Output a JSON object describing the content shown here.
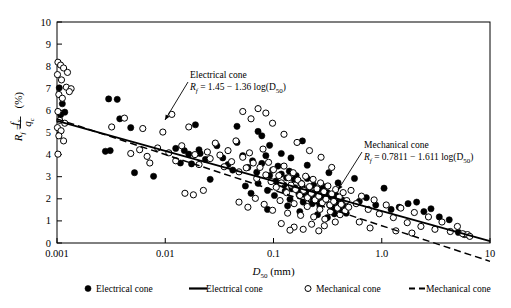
{
  "chart_data": {
    "type": "scatter",
    "title": "",
    "xlabel": "D50 (mm)",
    "xlabel_parts": {
      "main": "D",
      "sub": "50",
      "unit": "(mm)"
    },
    "ylabel": "Rf = fs/qc (%)",
    "ylabel_parts": {
      "r": "R",
      "rsub": "f",
      "eq": "=",
      "num": "f",
      "numsub": "s",
      "den": "q",
      "densub": "c",
      "unit": "(%)"
    },
    "xscale": "log",
    "xlim": [
      0.001,
      10
    ],
    "ylim": [
      0,
      10
    ],
    "xticks": [
      0.001,
      0.01,
      0.1,
      1.0,
      10
    ],
    "xtick_labels": [
      "0.001",
      "0.01",
      "0.1",
      "1.0",
      "10"
    ],
    "yticks": [
      0,
      1,
      2,
      3,
      4,
      5,
      6,
      7,
      8,
      9,
      10
    ],
    "ytick_labels": [
      "0",
      "1",
      "2",
      "3",
      "4",
      "5",
      "6",
      "7",
      "8",
      "9",
      "10"
    ],
    "grid": false,
    "legend_position": "bottom",
    "series": [
      {
        "name": "Electrical cone",
        "marker": "filled-circle",
        "color": "#000000",
        "points": [
          [
            0.00105,
            7.02
          ],
          [
            0.00112,
            6.3
          ],
          [
            0.00118,
            5.92
          ],
          [
            0.00108,
            5.8
          ],
          [
            0.003,
            6.52
          ],
          [
            0.0036,
            6.5
          ],
          [
            0.0038,
            5.62
          ],
          [
            0.0048,
            5.22
          ],
          [
            0.0028,
            4.15
          ],
          [
            0.0031,
            4.18
          ],
          [
            0.0052,
            3.18
          ],
          [
            0.0078,
            3.02
          ],
          [
            0.0125,
            4.28
          ],
          [
            0.015,
            4.18
          ],
          [
            0.0138,
            3.62
          ],
          [
            0.0175,
            3.58
          ],
          [
            0.019,
            5.35
          ],
          [
            0.0205,
            4.22
          ],
          [
            0.0235,
            3.78
          ],
          [
            0.026,
            2.88
          ],
          [
            0.021,
            4.05
          ],
          [
            0.0165,
            4.02
          ],
          [
            0.03,
            4.4
          ],
          [
            0.034,
            3.85
          ],
          [
            0.038,
            3.55
          ],
          [
            0.042,
            3.3
          ],
          [
            0.046,
            4.55
          ],
          [
            0.052,
            3.95
          ],
          [
            0.058,
            3.42
          ],
          [
            0.064,
            3.72
          ],
          [
            0.07,
            3.2
          ],
          [
            0.078,
            3.6
          ],
          [
            0.085,
            3.95
          ],
          [
            0.092,
            3.05
          ],
          [
            0.098,
            3.3
          ],
          [
            0.105,
            2.8
          ],
          [
            0.11,
            3.48
          ],
          [
            0.118,
            3.12
          ],
          [
            0.125,
            2.62
          ],
          [
            0.132,
            2.95
          ],
          [
            0.14,
            3.25
          ],
          [
            0.148,
            2.45
          ],
          [
            0.155,
            2.88
          ],
          [
            0.162,
            3.05
          ],
          [
            0.17,
            2.32
          ],
          [
            0.178,
            2.72
          ],
          [
            0.185,
            2.55
          ],
          [
            0.195,
            2.2
          ],
          [
            0.205,
            2.92
          ],
          [
            0.215,
            2.48
          ],
          [
            0.225,
            2.05
          ],
          [
            0.235,
            2.62
          ],
          [
            0.245,
            2.3
          ],
          [
            0.255,
            1.88
          ],
          [
            0.265,
            2.42
          ],
          [
            0.278,
            2.12
          ],
          [
            0.29,
            2.55
          ],
          [
            0.302,
            1.95
          ],
          [
            0.315,
            2.28
          ],
          [
            0.33,
            1.72
          ],
          [
            0.345,
            2.08
          ],
          [
            0.36,
            1.6
          ],
          [
            0.375,
            2.18
          ],
          [
            0.392,
            1.82
          ],
          [
            0.41,
            1.48
          ],
          [
            0.43,
            1.95
          ],
          [
            0.45,
            1.65
          ],
          [
            0.47,
            1.35
          ],
          [
            0.055,
            2.58
          ],
          [
            0.062,
            2.25
          ],
          [
            0.072,
            2.7
          ],
          [
            0.088,
            2.38
          ],
          [
            0.102,
            2.15
          ],
          [
            0.115,
            2.68
          ],
          [
            0.128,
            2.35
          ],
          [
            0.142,
            1.98
          ],
          [
            0.158,
            2.5
          ],
          [
            0.172,
            2.18
          ],
          [
            0.188,
            1.85
          ],
          [
            0.208,
            2.35
          ],
          [
            0.228,
            1.78
          ],
          [
            0.248,
            2.12
          ],
          [
            0.268,
            1.68
          ],
          [
            0.288,
            2.02
          ],
          [
            0.56,
            2.92
          ],
          [
            0.62,
            1.88
          ],
          [
            0.72,
            2.05
          ],
          [
            0.88,
            1.72
          ],
          [
            1.05,
            2.48
          ],
          [
            1.22,
            1.52
          ],
          [
            1.45,
            1.62
          ],
          [
            1.75,
            1.78
          ],
          [
            2.1,
            1.85
          ],
          [
            2.45,
            1.42
          ],
          [
            2.85,
            1.55
          ],
          [
            3.4,
            1.18
          ],
          [
            4.2,
            1.05
          ],
          [
            5.1,
            0.48
          ],
          [
            5.8,
            0.38
          ],
          [
            0.185,
            4.62
          ],
          [
            0.078,
            4.85
          ],
          [
            0.092,
            4.42
          ],
          [
            0.118,
            4.05
          ],
          [
            0.145,
            3.85
          ],
          [
            0.205,
            3.52
          ],
          [
            0.072,
            5.05
          ],
          [
            0.046,
            5.28
          ],
          [
            0.325,
            3.18
          ],
          [
            0.395,
            2.72
          ],
          [
            0.088,
            1.52
          ],
          [
            0.135,
            1.68
          ],
          [
            0.175,
            1.42
          ],
          [
            0.255,
            1.28
          ],
          [
            0.315,
            1.15
          ],
          [
            0.365,
            1.32
          ]
        ]
      },
      {
        "name": "Mechanical cone",
        "marker": "open-circle",
        "color": "#000000",
        "points": [
          [
            0.00102,
            8.18
          ],
          [
            0.00108,
            8.05
          ],
          [
            0.00115,
            7.92
          ],
          [
            0.00101,
            7.62
          ],
          [
            0.0011,
            7.38
          ],
          [
            0.00122,
            7.05
          ],
          [
            0.00135,
            6.98
          ],
          [
            0.00104,
            6.72
          ],
          [
            0.00112,
            6.55
          ],
          [
            0.00102,
            5.95
          ],
          [
            0.00106,
            5.55
          ],
          [
            0.00118,
            5.42
          ],
          [
            0.00101,
            5.22
          ],
          [
            0.00109,
            5.08
          ],
          [
            0.00104,
            4.85
          ],
          [
            0.00115,
            4.62
          ],
          [
            0.00102,
            4.02
          ],
          [
            0.00125,
            7.72
          ],
          [
            0.0013,
            6.85
          ],
          [
            0.00098,
            8.35
          ],
          [
            0.0042,
            5.65
          ],
          [
            0.0032,
            5.25
          ],
          [
            0.0062,
            5.18
          ],
          [
            0.0058,
            4.22
          ],
          [
            0.0048,
            4.05
          ],
          [
            0.0068,
            3.92
          ],
          [
            0.0085,
            4.3
          ],
          [
            0.0072,
            3.62
          ],
          [
            0.0108,
            4.08
          ],
          [
            0.0125,
            3.72
          ],
          [
            0.0095,
            5.02
          ],
          [
            0.0115,
            5.82
          ],
          [
            0.0142,
            4.4
          ],
          [
            0.0165,
            5.25
          ],
          [
            0.0188,
            4.0
          ],
          [
            0.0205,
            3.55
          ],
          [
            0.0152,
            2.25
          ],
          [
            0.0182,
            2.18
          ],
          [
            0.0225,
            2.38
          ],
          [
            0.0245,
            4.12
          ],
          [
            0.026,
            3.82
          ],
          [
            0.029,
            4.52
          ],
          [
            0.032,
            3.98
          ],
          [
            0.035,
            3.45
          ],
          [
            0.038,
            4.18
          ],
          [
            0.041,
            3.68
          ],
          [
            0.045,
            4.62
          ],
          [
            0.048,
            3.22
          ],
          [
            0.052,
            3.88
          ],
          [
            0.056,
            3.4
          ],
          [
            0.06,
            4.08
          ],
          [
            0.065,
            3.62
          ],
          [
            0.07,
            2.92
          ],
          [
            0.075,
            3.42
          ],
          [
            0.08,
            4.25
          ],
          [
            0.085,
            3.08
          ],
          [
            0.09,
            3.65
          ],
          [
            0.095,
            2.78
          ],
          [
            0.1,
            3.32
          ],
          [
            0.106,
            2.52
          ],
          [
            0.112,
            3.05
          ],
          [
            0.118,
            2.72
          ],
          [
            0.125,
            3.48
          ],
          [
            0.132,
            2.28
          ],
          [
            0.138,
            2.95
          ],
          [
            0.145,
            2.62
          ],
          [
            0.152,
            3.18
          ],
          [
            0.16,
            2.42
          ],
          [
            0.168,
            2.85
          ],
          [
            0.175,
            2.15
          ],
          [
            0.182,
            2.68
          ],
          [
            0.19,
            2.38
          ],
          [
            0.198,
            3.02
          ],
          [
            0.206,
            2.05
          ],
          [
            0.215,
            2.55
          ],
          [
            0.224,
            2.25
          ],
          [
            0.232,
            2.88
          ],
          [
            0.242,
            1.95
          ],
          [
            0.252,
            2.45
          ],
          [
            0.262,
            2.12
          ],
          [
            0.272,
            2.72
          ],
          [
            0.282,
            1.82
          ],
          [
            0.292,
            2.32
          ],
          [
            0.305,
            1.98
          ],
          [
            0.318,
            2.58
          ],
          [
            0.332,
            1.72
          ],
          [
            0.345,
            2.22
          ],
          [
            0.36,
            1.88
          ],
          [
            0.375,
            2.42
          ],
          [
            0.39,
            1.58
          ],
          [
            0.405,
            2.08
          ],
          [
            0.422,
            1.75
          ],
          [
            0.44,
            2.28
          ],
          [
            0.458,
            1.45
          ],
          [
            0.475,
            1.92
          ],
          [
            0.495,
            1.62
          ],
          [
            0.048,
            1.85
          ],
          [
            0.058,
            1.62
          ],
          [
            0.068,
            2.02
          ],
          [
            0.082,
            1.75
          ],
          [
            0.098,
            1.48
          ],
          [
            0.115,
            1.92
          ],
          [
            0.135,
            1.35
          ],
          [
            0.155,
            1.78
          ],
          [
            0.178,
            1.25
          ],
          [
            0.205,
            1.65
          ],
          [
            0.235,
            1.18
          ],
          [
            0.268,
            1.52
          ],
          [
            0.298,
            1.08
          ],
          [
            0.335,
            1.42
          ],
          [
            0.372,
            0.95
          ],
          [
            0.412,
            1.28
          ],
          [
            0.155,
            0.72
          ],
          [
            0.188,
            0.62
          ],
          [
            0.225,
            0.85
          ],
          [
            0.262,
            0.55
          ],
          [
            0.295,
            0.78
          ],
          [
            0.118,
            0.88
          ],
          [
            0.142,
            0.58
          ],
          [
            0.52,
            2.38
          ],
          [
            0.58,
            1.78
          ],
          [
            0.65,
            2.12
          ],
          [
            0.75,
            1.52
          ],
          [
            0.85,
            1.95
          ],
          [
            0.95,
            1.32
          ],
          [
            1.1,
            1.72
          ],
          [
            1.28,
            1.15
          ],
          [
            1.5,
            1.58
          ],
          [
            1.72,
            0.92
          ],
          [
            2.0,
            1.38
          ],
          [
            2.3,
            0.75
          ],
          [
            2.7,
            1.18
          ],
          [
            3.1,
            0.62
          ],
          [
            3.6,
            0.95
          ],
          [
            4.3,
            0.52
          ],
          [
            5.0,
            0.75
          ],
          [
            5.6,
            0.42
          ],
          [
            6.2,
            0.38
          ],
          [
            6.5,
            0.3
          ],
          [
            0.62,
            0.95
          ],
          [
            0.78,
            0.68
          ],
          [
            1.35,
            0.55
          ],
          [
            1.9,
            0.45
          ],
          [
            0.098,
            5.42
          ],
          [
            0.085,
            5.88
          ],
          [
            0.125,
            4.92
          ],
          [
            0.165,
            4.55
          ],
          [
            0.215,
            4.18
          ],
          [
            0.062,
            5.62
          ],
          [
            0.275,
            3.88
          ],
          [
            0.345,
            3.42
          ],
          [
            0.072,
            6.08
          ],
          [
            0.052,
            5.95
          ]
        ]
      }
    ],
    "fits": [
      {
        "name": "Electrical cone",
        "style": "solid",
        "intercept": 1.45,
        "slope": -1.36,
        "equation_label": "Rf = 1.45 − 1.36 log(D50)",
        "annotation_title": "Electrical cone"
      },
      {
        "name": "Mechanical cone",
        "style": "dashed",
        "intercept": 0.7811,
        "slope": -1.611,
        "equation_label": "Rf = 0.7811 − 1.611 log(D50)",
        "annotation_title": "Mechanical cone"
      }
    ],
    "annotations": [
      {
        "id": "electrical",
        "title": "Electrical cone",
        "eq_lhs": "R",
        "eq_lhs_sub": "f",
        "eq_rhs": "= 1.45 − 1.36 log(D",
        "eq_rhs_sub": "50",
        "eq_tail": ")"
      },
      {
        "id": "mechanical",
        "title": "Mechanical cone",
        "eq_lhs": "R",
        "eq_lhs_sub": "f",
        "eq_rhs": "= 0.7811 − 1.611 log(D",
        "eq_rhs_sub": "50",
        "eq_tail": ")"
      }
    ],
    "legend": [
      {
        "label": "Electrical cone",
        "type": "filled-circle"
      },
      {
        "label": "Electrical cone",
        "type": "solid-line"
      },
      {
        "label": "Mechanical cone",
        "type": "open-circle"
      },
      {
        "label": "Mechanical cone",
        "type": "dashed-line"
      }
    ]
  }
}
